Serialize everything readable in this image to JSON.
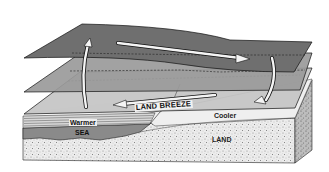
{
  "diagram": {
    "labels": {
      "land_breeze": "LAND BREEZE",
      "warmer": "Warmer",
      "sea": "SEA",
      "cooler": "Cooler",
      "land": "LAND"
    },
    "layers": [
      {
        "name": "upper-pressure-surface",
        "color": "#6f6f6f"
      },
      {
        "name": "middle-pressure-surface",
        "color": "#9a9a9a"
      },
      {
        "name": "lower-pressure-surface",
        "color": "#c4c4c4"
      }
    ],
    "arrows": [
      {
        "name": "rising-air-over-sea",
        "direction": "up"
      },
      {
        "name": "upper-flow-toward-land",
        "direction": "right"
      },
      {
        "name": "sinking-air-over-land",
        "direction": "down"
      },
      {
        "name": "land-breeze-flow-toward-sea",
        "direction": "left"
      }
    ],
    "colors": {
      "sea": "#8a8a8a",
      "land": "#e6e6e6",
      "outline": "#111111"
    }
  }
}
